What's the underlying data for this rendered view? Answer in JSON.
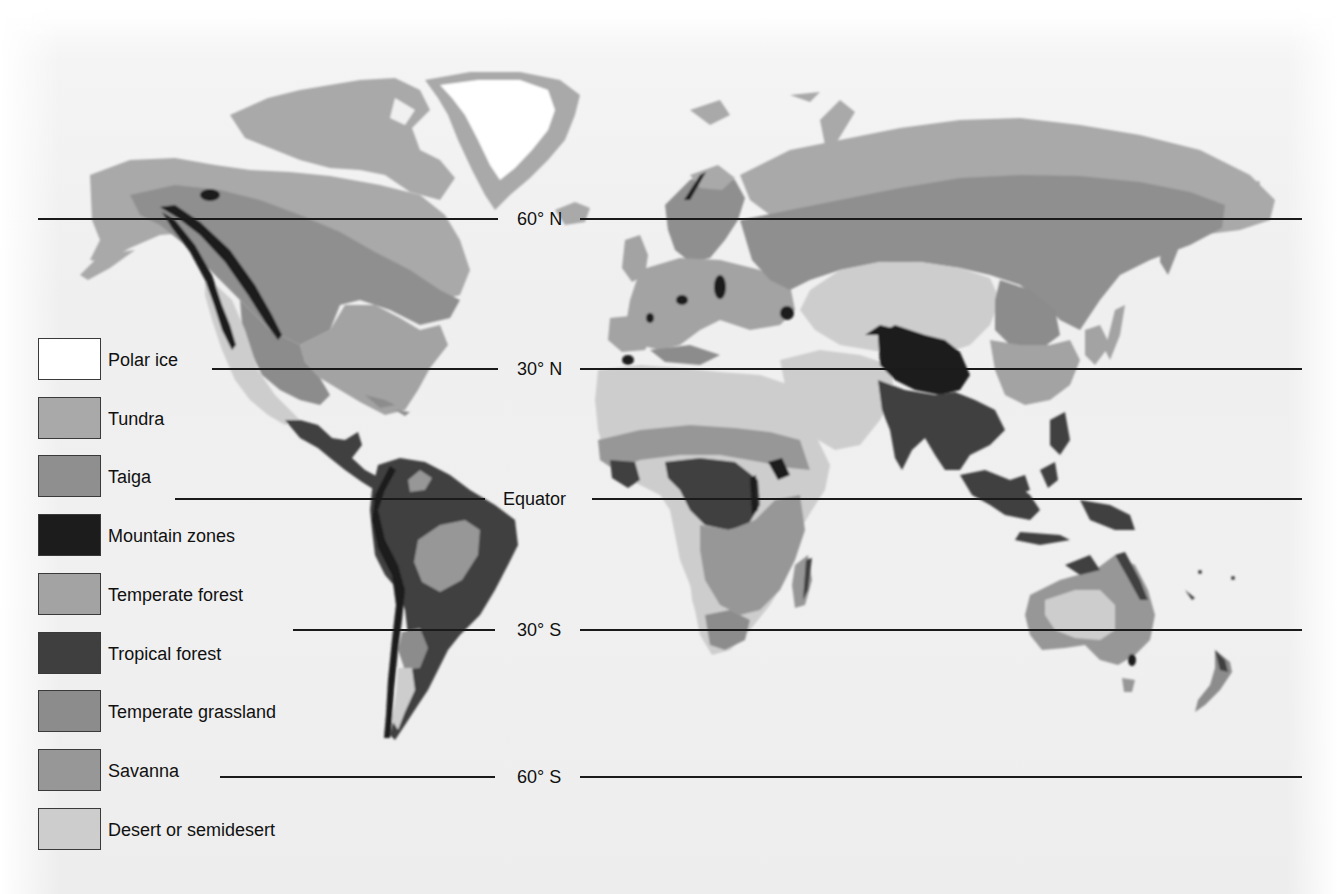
{
  "map": {
    "type": "world biome map",
    "latitude_lines": [
      {
        "label": "60° N",
        "y": 219,
        "x_start": 38,
        "x_end": 1302,
        "label_x": 517
      },
      {
        "label": "30° N",
        "y": 369,
        "x_start": 212,
        "x_end": 1302,
        "label_x": 517
      },
      {
        "label": "Equator",
        "y": 499,
        "x_start": 175,
        "x_end": 1302,
        "label_x": 505
      },
      {
        "label": "30° S",
        "y": 630,
        "x_start": 293,
        "x_end": 1302,
        "label_x": 517
      },
      {
        "label": "60° S",
        "y": 777,
        "x_start": 220,
        "x_end": 1302,
        "label_x": 517
      }
    ]
  },
  "legend": {
    "items": [
      {
        "label": "Polar ice",
        "color": "#ffffff"
      },
      {
        "label": "Tundra",
        "color": "#a9a9a9"
      },
      {
        "label": "Taiga",
        "color": "#8f8f8f"
      },
      {
        "label": "Mountain zones",
        "color": "#1c1c1c"
      },
      {
        "label": "Temperate forest",
        "color": "#a3a3a3"
      },
      {
        "label": "Tropical forest",
        "color": "#3f3f3f"
      },
      {
        "label": "Temperate grassland",
        "color": "#8c8c8c"
      },
      {
        "label": "Savanna",
        "color": "#979797"
      },
      {
        "label": "Desert or semidesert",
        "color": "#cdcdcd"
      }
    ]
  },
  "colors": {
    "polar_ice": "#ffffff",
    "tundra": "#a9a9a9",
    "taiga": "#8f8f8f",
    "mountain": "#1c1c1c",
    "temperate_forest": "#a3a3a3",
    "tropical_forest": "#3f3f3f",
    "temperate_grassland": "#8c8c8c",
    "savanna": "#979797",
    "desert": "#cdcdcd"
  }
}
